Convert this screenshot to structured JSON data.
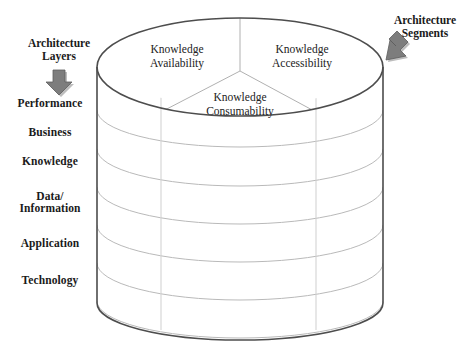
{
  "figure": {
    "background_color": "#ffffff",
    "outline_color": "#5a5a5a",
    "inner_line_color": "#b9b9b9",
    "arrow_color": "#7a7a7a",
    "text_color": "#1a1a1a"
  },
  "callouts": {
    "layers": {
      "line1": "Architecture",
      "line2": "Layers",
      "arrow_icon": "down-arrow-icon",
      "arrow_direction": "down"
    },
    "segments": {
      "line1": "Architecture",
      "line2": "Segments",
      "arrow_icon": "diagonal-arrow-icon",
      "arrow_direction": "down-left"
    }
  },
  "architecture_layers": [
    {
      "label": "Performance",
      "index": 1
    },
    {
      "label": "Business",
      "index": 2
    },
    {
      "label": "Knowledge",
      "index": 3
    },
    {
      "label": "Data/",
      "label2": "Information",
      "index": 4
    },
    {
      "label": "Application",
      "index": 5
    },
    {
      "label": "Technology",
      "index": 6
    }
  ],
  "architecture_segments": [
    {
      "line1": "Knowledge",
      "line2": "Availability",
      "position": "top-left"
    },
    {
      "line1": "Knowledge",
      "line2": "Accessibility",
      "position": "top-right"
    },
    {
      "line1": "Knowledge",
      "line2": "Consumability",
      "position": "front-center"
    }
  ]
}
